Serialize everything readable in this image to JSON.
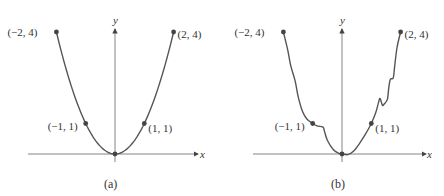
{
  "chart_data": [
    {
      "type": "line",
      "caption": "(a)",
      "xlabel": "x",
      "ylabel": "y",
      "xlim": [
        -2.5,
        2.5
      ],
      "ylim": [
        0,
        4
      ],
      "grid": false,
      "curve": "y = x^2",
      "points": [
        {
          "x": -2,
          "y": 4,
          "label": "(−2, 4)"
        },
        {
          "x": -1,
          "y": 1,
          "label": "(−1, 1)"
        },
        {
          "x": 0,
          "y": 0,
          "label": ""
        },
        {
          "x": 1,
          "y": 1,
          "label": "(1, 1)"
        },
        {
          "x": 2,
          "y": 4,
          "label": "(2, 4)"
        }
      ],
      "line_color": "#555555"
    },
    {
      "type": "line",
      "caption": "(b)",
      "xlabel": "x",
      "ylabel": "y",
      "xlim": [
        -2.5,
        2.5
      ],
      "ylim": [
        0,
        4
      ],
      "grid": false,
      "curve": "irregular curve through same points",
      "points": [
        {
          "x": -2,
          "y": 4,
          "label": "(−2, 4)"
        },
        {
          "x": -1,
          "y": 1,
          "label": "(−1, 1)"
        },
        {
          "x": 0,
          "y": 0,
          "label": ""
        },
        {
          "x": 1,
          "y": 1,
          "label": "(1, 1)"
        },
        {
          "x": 2,
          "y": 4,
          "label": "(2, 4)"
        }
      ],
      "wiggly_path": [
        [
          -2,
          4
        ],
        [
          -1.85,
          3.4
        ],
        [
          -1.75,
          2.9
        ],
        [
          -1.6,
          2.4
        ],
        [
          -1.5,
          1.9
        ],
        [
          -1.35,
          1.4
        ],
        [
          -1.2,
          1.15
        ],
        [
          -1,
          1
        ],
        [
          -0.85,
          0.92
        ],
        [
          -0.65,
          0.88
        ],
        [
          -0.6,
          0.75
        ],
        [
          -0.5,
          0.45
        ],
        [
          -0.3,
          0.15
        ],
        [
          -0.1,
          0.02
        ],
        [
          0,
          0
        ],
        [
          0.2,
          -0.02
        ],
        [
          0.4,
          0.1
        ],
        [
          0.6,
          0.35
        ],
        [
          0.8,
          0.65
        ],
        [
          1,
          1
        ],
        [
          1.15,
          1.35
        ],
        [
          1.25,
          1.7
        ],
        [
          1.3,
          1.82
        ],
        [
          1.38,
          1.6
        ],
        [
          1.45,
          1.65
        ],
        [
          1.55,
          1.8
        ],
        [
          1.6,
          2.2
        ],
        [
          1.65,
          2.45
        ],
        [
          1.75,
          2.5
        ],
        [
          1.8,
          2.9
        ],
        [
          1.88,
          3.5
        ],
        [
          2,
          4
        ]
      ],
      "line_color": "#555555"
    }
  ]
}
